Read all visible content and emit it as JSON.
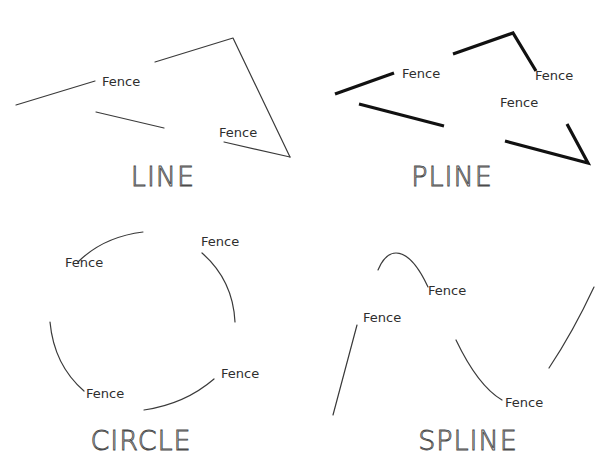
{
  "figure": {
    "colors": {
      "background": "#ffffff",
      "line": "#3a3a3a",
      "pline": "#111111",
      "text": "#2e2e2e"
    }
  },
  "panels": [
    {
      "id": "line",
      "title": "LINE",
      "title_pos": [
        163,
        186
      ],
      "labels": [
        {
          "text": "Fence",
          "x": 102,
          "y": 86
        },
        {
          "text": "Fence",
          "x": 219,
          "y": 137
        }
      ]
    },
    {
      "id": "pline",
      "title": "PLINE",
      "title_pos": [
        452,
        186
      ],
      "labels": [
        {
          "text": "Fence",
          "x": 402,
          "y": 78
        },
        {
          "text": "Fence",
          "x": 535,
          "y": 80
        },
        {
          "text": "Fence",
          "x": 500,
          "y": 107
        }
      ]
    },
    {
      "id": "circle",
      "title": "CIRCLE",
      "title_pos": [
        141,
        450
      ],
      "labels": [
        {
          "text": "Fence",
          "x": 65,
          "y": 267
        },
        {
          "text": "Fence",
          "x": 201,
          "y": 246
        },
        {
          "text": "Fence",
          "x": 221,
          "y": 378
        },
        {
          "text": "Fence",
          "x": 86,
          "y": 398
        }
      ]
    },
    {
      "id": "spline",
      "title": "SPLINE",
      "title_pos": [
        468,
        450
      ],
      "labels": [
        {
          "text": "Fence",
          "x": 428,
          "y": 295
        },
        {
          "text": "Fence",
          "x": 363,
          "y": 322
        },
        {
          "text": "Fence",
          "x": 505,
          "y": 407
        }
      ]
    }
  ]
}
